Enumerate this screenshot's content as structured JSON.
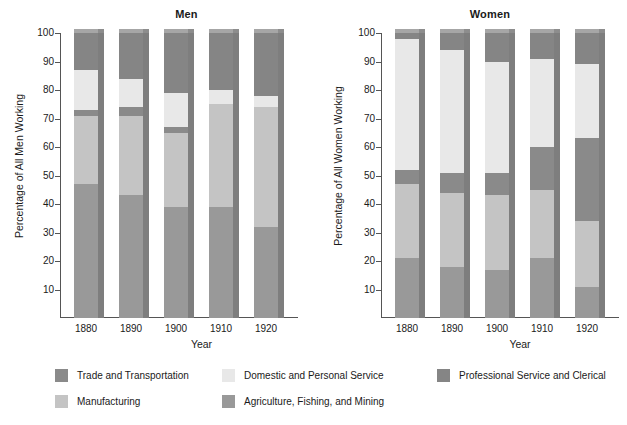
{
  "chart_data": {
    "type": "bar",
    "subtype": "stacked-percentage-3d",
    "title": "",
    "panels": [
      {
        "name": "men",
        "title": "Men",
        "ylabel": "Percentage of All Men Working",
        "xlabel": "Year",
        "categories": [
          "1880",
          "1890",
          "1900",
          "1910",
          "1920"
        ],
        "ylim": [
          0,
          100
        ],
        "yticks": [
          10,
          20,
          30,
          40,
          50,
          60,
          70,
          80,
          90,
          100
        ],
        "grid": false,
        "series": [
          {
            "name": "Agriculture, Fishing, and Mining",
            "values": [
              47,
              43,
              39,
              39,
              32
            ]
          },
          {
            "name": "Manufacturing",
            "values": [
              24,
              28,
              26,
              36,
              42
            ]
          },
          {
            "name": "Trade and Transportation",
            "values": [
              2,
              3,
              2,
              0,
              0
            ]
          },
          {
            "name": "Domestic and Personal Service",
            "values": [
              14,
              10,
              12,
              5,
              4
            ]
          },
          {
            "name": "Professional Service and Clerical",
            "values": [
              13,
              16,
              21,
              20,
              22
            ]
          }
        ]
      },
      {
        "name": "women",
        "title": "Women",
        "ylabel": "Percentage of All Women Working",
        "xlabel": "Year",
        "categories": [
          "1880",
          "1890",
          "1900",
          "1910",
          "1920"
        ],
        "ylim": [
          0,
          100
        ],
        "yticks": [
          10,
          20,
          30,
          40,
          50,
          60,
          70,
          80,
          90,
          100
        ],
        "grid": false,
        "series": [
          {
            "name": "Agriculture, Fishing, and Mining",
            "values": [
              21,
              18,
              17,
              21,
              11
            ]
          },
          {
            "name": "Manufacturing",
            "values": [
              26,
              26,
              26,
              24,
              23
            ]
          },
          {
            "name": "Trade and Transportation",
            "values": [
              5,
              7,
              8,
              15,
              29
            ]
          },
          {
            "name": "Domestic and Personal Service",
            "values": [
              46,
              43,
              39,
              31,
              26
            ]
          },
          {
            "name": "Professional Service and Clerical",
            "values": [
              2,
              6,
              10,
              9,
              11
            ]
          }
        ]
      }
    ],
    "legend": {
      "position": "bottom",
      "entries": [
        {
          "label": "Trade and Transportation",
          "color": "#8a8a8a"
        },
        {
          "label": "Domestic and Personal Service",
          "color": "#e8e8e8"
        },
        {
          "label": "Professional Service and Clerical",
          "color": "#858585"
        },
        {
          "label": "Manufacturing",
          "color": "#c4c4c4"
        },
        {
          "label": "Agriculture, Fishing, and Mining",
          "color": "#999999"
        }
      ]
    },
    "colors": {
      "trade_and_transportation": "#8a8a8a",
      "domestic_and_personal_service": "#e8e8e8",
      "professional_service_and_clerical": "#858585",
      "manufacturing": "#c4c4c4",
      "agriculture_fishing_and_mining": "#999999",
      "bar_side_shadow": "#7e7e7e",
      "axis": "#555555",
      "background": "#ffffff",
      "text": "#1a1a1a"
    }
  }
}
